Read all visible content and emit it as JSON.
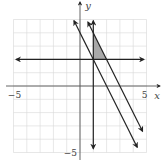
{
  "chart_data": {
    "type": "line",
    "title": "",
    "xlabel": "x",
    "ylabel": "y",
    "xlim": [
      -5,
      5
    ],
    "ylim": [
      -5,
      5
    ],
    "grid": true,
    "x_tick_labels": [
      {
        "value": -5,
        "text": "−5"
      },
      {
        "value": 5,
        "text": "5"
      }
    ],
    "y_tick_labels": [
      {
        "value": -5,
        "text": "−5"
      }
    ],
    "series": [
      {
        "name": "horizontal-line",
        "equation": "y = 2",
        "kind": "horizontal",
        "y": 2,
        "x_range": [
          -4.8,
          4.8
        ],
        "arrows": "both"
      },
      {
        "name": "vertical-line",
        "equation": "x = 1",
        "kind": "vertical",
        "x": 1,
        "y_range": [
          -4.7,
          4.9
        ],
        "arrows": "both"
      },
      {
        "name": "line-1",
        "equation": "y = -2x + 4",
        "kind": "linear",
        "slope": -2,
        "intercept": 4,
        "x_range": [
          -0.45,
          4.3
        ],
        "arrows": "both"
      },
      {
        "name": "line-2",
        "equation": "y = -2x + 6",
        "kind": "linear",
        "slope": -2,
        "intercept": 6,
        "x_range": [
          0.6,
          4.7
        ],
        "arrows": "both"
      }
    ],
    "shaded_region": {
      "description": "feasible region",
      "vertices": [
        [
          1,
          2
        ],
        [
          2,
          2
        ],
        [
          1,
          4
        ]
      ],
      "color": "#9a9a9a"
    }
  }
}
